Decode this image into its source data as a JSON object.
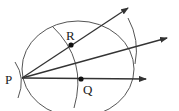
{
  "diagram": {
    "colors": {
      "line": "#333333",
      "arc": "#444444",
      "point": "#111111",
      "background": "#ffffff"
    },
    "points": {
      "P": {
        "label": "P",
        "x": 22,
        "y": 78
      },
      "R": {
        "label": "R",
        "x": 71,
        "y": 45
      },
      "Q": {
        "label": "Q",
        "x": 81,
        "y": 79
      }
    },
    "rays": [
      {
        "name": "ray-PR",
        "from": "P",
        "to": [
          128,
          8
        ]
      },
      {
        "name": "bisector",
        "from": "P",
        "to": [
          167,
          38
        ]
      },
      {
        "name": "ray-PQ",
        "from": "P",
        "to": [
          146,
          79
        ]
      }
    ],
    "labels": {
      "P": "P",
      "R": "R",
      "Q": "Q"
    }
  }
}
